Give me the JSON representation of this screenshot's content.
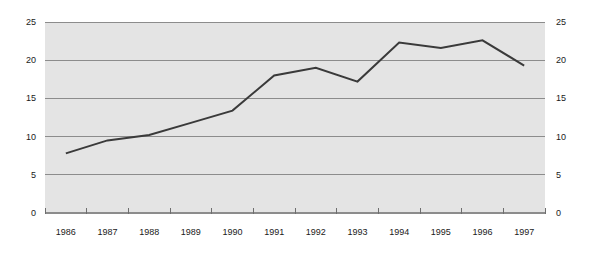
{
  "chart_data": {
    "type": "line",
    "title": "",
    "subtitle": "",
    "xlabel": "",
    "ylabel": "",
    "categories": [
      "1986",
      "1987",
      "1988",
      "1989",
      "1990",
      "1991",
      "1992",
      "1993",
      "1994",
      "1995",
      "1996",
      "1997"
    ],
    "values": [
      7.8,
      9.5,
      10.2,
      11.8,
      13.4,
      18.0,
      19.0,
      17.2,
      22.3,
      21.6,
      22.6,
      19.3
    ],
    "series": [
      {
        "name": "",
        "values": [
          7.8,
          9.5,
          10.2,
          11.8,
          13.4,
          18.0,
          19.0,
          17.2,
          22.3,
          21.6,
          22.6,
          19.3
        ]
      }
    ],
    "ylim": [
      0,
      25
    ],
    "y_ticks": [
      0,
      5,
      10,
      15,
      20,
      25
    ],
    "y_tick_labels_left": [
      "0",
      "5",
      "10",
      "15",
      "20",
      "25"
    ],
    "y_tick_labels_right": [
      "0",
      "5",
      "10",
      "15",
      "20",
      "25"
    ],
    "x_tick_labels": [
      "1986",
      "1987",
      "1988",
      "1989",
      "1990",
      "1991",
      "1992",
      "1993",
      "1994",
      "1995",
      "1996",
      "1997"
    ],
    "grid": true,
    "grid_axis": "y",
    "legend": false,
    "legend_position": "none",
    "dual_y_axis": true,
    "annotations": []
  },
  "style": {
    "plot_background": "#e4e4e4",
    "page_background": "#ffffff",
    "grid_color": "#8c8c8c",
    "line_color": "#3a3a3a",
    "axis_color": "#6e6e6e",
    "text_color": "#1a1a1a"
  },
  "axes": {
    "left_axis_name": "left-value-axis",
    "right_axis_name": "right-value-axis",
    "bottom_axis_name": "year-category-axis"
  }
}
